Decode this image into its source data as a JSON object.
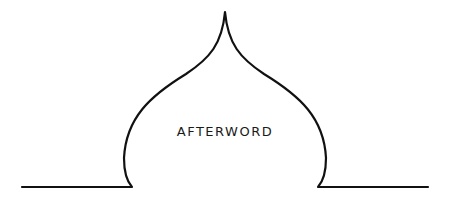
{
  "heading": {
    "title": "AFTERWORD"
  },
  "ornament": {
    "name": "onion-dome-arch",
    "stroke_color": "#111111"
  }
}
